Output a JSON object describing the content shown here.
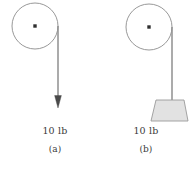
{
  "figure": {
    "type": "physics-diagram",
    "background_color": "#ffffff",
    "stroke_color": "#8c8c8c",
    "rope_color": "#8f8f8f",
    "arrow_color": "#4a4a4a",
    "block_fill": "#e2e2e2",
    "block_stroke": "#9a9a9a",
    "text_color": "#3a3a3a"
  },
  "panels": [
    {
      "id": "a",
      "panel_label": "(a)",
      "load_label": "10 lb",
      "pulley": {
        "center_x": 35,
        "center_y": 26,
        "radius": 23,
        "axle_dot": true
      },
      "rope": {
        "x": 58,
        "from_y": 26,
        "to_y": 96
      },
      "force_arrow": {
        "direction": "down",
        "tip_x": 58,
        "tip_y": 108,
        "head_width": 7,
        "head_length": 12
      },
      "block": null
    },
    {
      "id": "b",
      "panel_label": "(b)",
      "load_label": "10 lb",
      "pulley": {
        "center_x": 149,
        "center_y": 27,
        "radius": 23,
        "axle_dot": true
      },
      "rope": {
        "x": 172,
        "from_y": 27,
        "to_y": 100
      },
      "force_arrow": null,
      "block": {
        "shape": "trapezoid",
        "top_left_x": 156,
        "top_right_x": 184,
        "bottom_left_x": 151,
        "bottom_right_x": 188,
        "top_y": 100,
        "bottom_y": 121
      }
    }
  ]
}
